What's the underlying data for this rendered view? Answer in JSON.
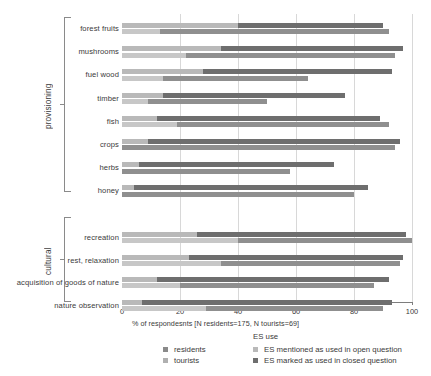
{
  "chart_data": {
    "type": "bar",
    "orientation": "horizontal",
    "stacked": true,
    "title": "",
    "xlabel": "% of respondesnts [N residents=175, N tourists=69]",
    "ylabel": "",
    "xlim": [
      0,
      100
    ],
    "xticks": [
      0,
      20,
      40,
      60,
      80,
      100
    ],
    "grid": true,
    "legend_position": "bottom",
    "groups": [
      {
        "name": "provisioning",
        "categories": [
          "forest fruits",
          "mushrooms",
          "fuel wood",
          "timber",
          "fish",
          "crops",
          "herbs",
          "honey"
        ]
      },
      {
        "name": "cultural",
        "categories": [
          "recreation",
          "rest, relaxation",
          "acquisition of goods of nature",
          "nature observation"
        ]
      }
    ],
    "categories": [
      "forest fruits",
      "mushrooms",
      "fuel wood",
      "timber",
      "fish",
      "crops",
      "herbs",
      "honey",
      "recreation",
      "rest, relaxation",
      "acquisition of goods of nature",
      "nature observation"
    ],
    "series": [
      {
        "name": "residents",
        "segments": [
          {
            "name": "ES mentioned as used in open question",
            "color": "#b9b9b9"
          },
          {
            "name": "ES marked as used in closed question",
            "color": "#6e6e6e"
          }
        ],
        "values_open": [
          40,
          34,
          28,
          14,
          12,
          9,
          6,
          4,
          26,
          23,
          12,
          7
        ],
        "values_total": [
          90,
          97,
          93,
          77,
          89,
          96,
          73,
          85,
          98,
          97,
          92,
          93
        ]
      },
      {
        "name": "tourists",
        "segments": [
          {
            "name": "ES mentioned as used in open question",
            "color": "#c7c7c7"
          },
          {
            "name": "ES marked as used in closed question",
            "color": "#8f8f8f"
          }
        ],
        "values_open": [
          13,
          22,
          14,
          9,
          19,
          0,
          0,
          0,
          40,
          34,
          20,
          29
        ],
        "values_total": [
          92,
          94,
          64,
          50,
          92,
          94,
          58,
          80,
          100,
          96,
          87,
          90
        ]
      }
    ],
    "xtick_labels": [
      "0",
      "20",
      "40",
      "60",
      "80",
      "100"
    ]
  },
  "legend": {
    "title": "ES use",
    "group_items": [
      {
        "label": "residents",
        "color": "#8a8a8a"
      },
      {
        "label": "tourists",
        "color": "#b0b0b0"
      }
    ],
    "use_items": [
      {
        "label": "ES mentioned as used in open question",
        "color": "#b9b9b9"
      },
      {
        "label": "ES marked as used in closed question",
        "color": "#6e6e6e"
      }
    ]
  }
}
